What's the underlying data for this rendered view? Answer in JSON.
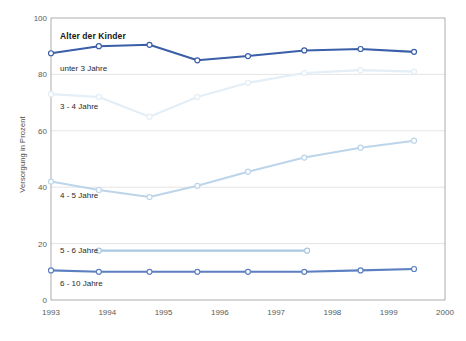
{
  "chart_data": {
    "type": "line",
    "title": "Alter der Kinder",
    "xlabel": "",
    "ylabel": "Versorgung in Prozent",
    "xlim": [
      1993,
      2000
    ],
    "ylim": [
      0,
      100
    ],
    "grid": "horizontal",
    "legend_position": "inline-left",
    "x_ticks": [
      "1993",
      "1994",
      "1995",
      "1996",
      "1997",
      "1998",
      "1999",
      "2000"
    ],
    "y_ticks": [
      "0",
      "20",
      "40",
      "60",
      "80",
      "100"
    ],
    "series": [
      {
        "name": "unter 3 Jahre",
        "color": "#3a5fa8",
        "x": [
          1993.0,
          1993.85,
          1994.75,
          1995.6,
          1996.5,
          1997.5,
          1998.5,
          1999.45
        ],
        "values": [
          87.5,
          90.0,
          90.5,
          85.0,
          86.5,
          88.5,
          89.0,
          88.0
        ]
      },
      {
        "name": "3 - 4 Jahre",
        "color": "#e3eef7",
        "x": [
          1993.0,
          1993.85,
          1994.75,
          1995.6,
          1996.5,
          1997.5,
          1998.5,
          1999.45
        ],
        "values": [
          73.0,
          72.0,
          65.0,
          72.0,
          77.0,
          80.5,
          81.5,
          81.0
        ]
      },
      {
        "name": "4 - 5 Jahre",
        "color": "#bcd5ea",
        "x": [
          1993.0,
          1993.85,
          1994.75,
          1995.6,
          1996.5,
          1997.5,
          1998.5,
          1999.45
        ],
        "values": [
          42.0,
          39.0,
          36.5,
          40.5,
          45.5,
          50.5,
          54.0,
          56.5
        ]
      },
      {
        "name": "5 - 6 Jahre",
        "color": "#a9c8e2",
        "x": [
          1993.85,
          1997.55
        ],
        "values": [
          17.5,
          17.5
        ]
      },
      {
        "name": "6 - 10 Jahre",
        "color": "#5b7fc0",
        "x": [
          1993.0,
          1993.85,
          1994.75,
          1995.6,
          1996.5,
          1997.5,
          1998.5,
          1999.45
        ],
        "values": [
          10.5,
          10.0,
          10.0,
          10.0,
          10.0,
          10.0,
          10.5,
          11.0
        ]
      }
    ],
    "series_label_positions": [
      {
        "name": "unter 3 Jahre",
        "x": 1993.0,
        "y": 82.0
      },
      {
        "name": "3 - 4 Jahre",
        "x": 1993.0,
        "y": 68.5
      },
      {
        "name": "4 - 5 Jahre",
        "x": 1993.0,
        "y": 37.0
      },
      {
        "name": "5 - 6 Jahre",
        "x": 1993.0,
        "y": 17.3
      },
      {
        "name": "6 - 10 Jahre",
        "x": 1993.0,
        "y": 5.5
      }
    ]
  },
  "axes": {
    "y_label": "Versorgung in Prozent"
  }
}
